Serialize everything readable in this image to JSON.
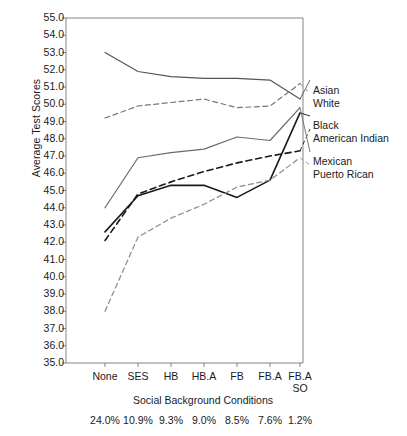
{
  "chart_data": {
    "type": "line",
    "title": "",
    "xlabel": "Social Background Conditions",
    "ylabel": "Average Test Scores",
    "categories": [
      "None",
      "SES",
      "HB",
      "HB.A",
      "FB",
      "FB.A",
      "FB.A SO"
    ],
    "category_percents": [
      "24.0%",
      "10.9%",
      "9.3%",
      "9.0%",
      "8.5%",
      "7.6%",
      "1.2%"
    ],
    "ylim": [
      35.0,
      55.0
    ],
    "ytick_labels": [
      "55.0",
      "54.0",
      "53.0",
      "52.0",
      "51.0",
      "50.0",
      "49.0",
      "48.0",
      "47.0",
      "46.0",
      "45.0",
      "44.0",
      "43.0",
      "42.0",
      "41.0",
      "40.0",
      "39.0",
      "38.0",
      "37.0",
      "36.0",
      "35.0"
    ],
    "grid": false,
    "legend_position": "right",
    "series": [
      {
        "name": "Asian",
        "style": "solid",
        "color": "#555555",
        "values": [
          53.0,
          51.9,
          51.6,
          51.5,
          51.5,
          51.4,
          50.3
        ]
      },
      {
        "name": "White",
        "style": "dashed",
        "color": "#777777",
        "values": [
          49.2,
          49.9,
          50.1,
          50.3,
          49.8,
          49.9,
          51.2
        ]
      },
      {
        "name": "Black",
        "style": "solid",
        "color": "#1a1a1a",
        "values": [
          42.6,
          44.7,
          45.3,
          45.3,
          44.6,
          45.6,
          49.5
        ]
      },
      {
        "name": "American Indian",
        "style": "dashed",
        "color": "#1a1a1a",
        "values": [
          42.1,
          44.8,
          45.5,
          46.1,
          46.6,
          47.0,
          47.3
        ]
      },
      {
        "name": "Mexican",
        "style": "solid",
        "color": "#6a6a6a",
        "values": [
          44.0,
          46.9,
          47.2,
          47.4,
          48.1,
          47.9,
          49.8
        ]
      },
      {
        "name": "Puerto Rican",
        "style": "dashed",
        "color": "#8a8a8a",
        "values": [
          38.0,
          42.3,
          43.4,
          44.2,
          45.2,
          45.6,
          46.9
        ]
      }
    ]
  },
  "legend_labels": [
    {
      "name": "Asian",
      "x": 313,
      "y": 84
    },
    {
      "name": "White",
      "x": 313,
      "y": 97
    },
    {
      "name": "Black",
      "x": 313,
      "y": 119
    },
    {
      "name": "American Indian",
      "x": 313,
      "y": 132
    },
    {
      "name": "Mexican",
      "x": 313,
      "y": 155
    },
    {
      "name": "Puerto Rican",
      "x": 313,
      "y": 168
    }
  ]
}
